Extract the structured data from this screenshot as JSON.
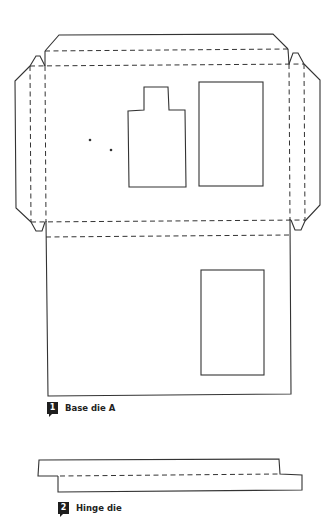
{
  "dies": [
    {
      "number": "1",
      "label": "Base die A"
    },
    {
      "number": "2",
      "label": "Hinge die"
    }
  ],
  "colors": {
    "line": "#333333",
    "badge": "#1e1e1e",
    "background": "#ffffff"
  },
  "legend": {
    "solid_line": "cut",
    "dashed_line": "fold"
  }
}
